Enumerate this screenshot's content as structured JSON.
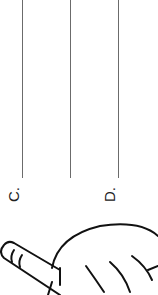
{
  "worksheet": {
    "orientation": "rotated-90",
    "answer_lines": [
      {
        "label": "C."
      },
      {
        "label": "D."
      }
    ],
    "illustration": "hand-holding-pencil",
    "line_color": "#6b6b6b",
    "ink_color": "#111111"
  }
}
